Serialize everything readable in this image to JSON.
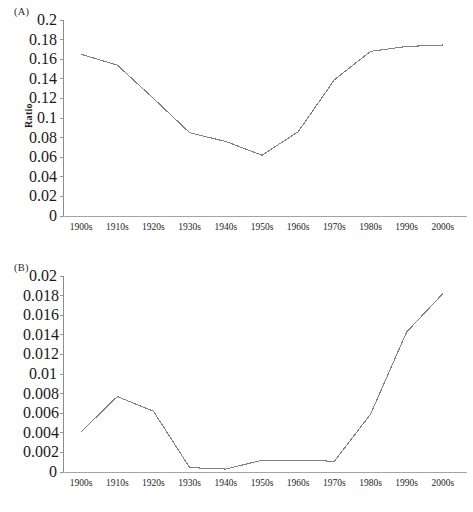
{
  "figure": {
    "panels": [
      {
        "key": "A",
        "label": "(A)",
        "ylabel": "Ratio"
      },
      {
        "key": "B",
        "label": "(B)",
        "ylabel": "Ratio"
      }
    ]
  },
  "chart_data": [
    {
      "panel": "(A)",
      "type": "line",
      "title": "",
      "xlabel": "",
      "ylabel": "Ratio",
      "categories": [
        "1900s",
        "1910s",
        "1920s",
        "1930s",
        "1940s",
        "1950s",
        "1960s",
        "1970s",
        "1980s",
        "1990s",
        "2000s"
      ],
      "values": [
        0.165,
        0.154,
        0.12,
        0.085,
        0.076,
        0.062,
        0.086,
        0.139,
        0.168,
        0.173,
        0.1745
      ],
      "ylim": [
        0,
        0.2
      ],
      "ytick_labels": [
        "0",
        "0.02",
        "0.04",
        "0.06",
        "0.08",
        "0.1",
        "0.12",
        "0.14",
        "0.16",
        "0.18",
        "0.2"
      ],
      "ytick_values": [
        0,
        0.02,
        0.04,
        0.06,
        0.08,
        0.1,
        0.12,
        0.14,
        0.16,
        0.18,
        0.2
      ],
      "grid": false,
      "legend": "none",
      "line_color": "#808080"
    },
    {
      "panel": "(B)",
      "type": "line",
      "title": "",
      "xlabel": "",
      "ylabel": "Ratio",
      "categories": [
        "1900s",
        "1910s",
        "1920s",
        "1930s",
        "1940s",
        "1950s",
        "1960s",
        "1970s",
        "1980s",
        "1990s",
        "2000s"
      ],
      "values": [
        0.0041,
        0.0077,
        0.0062,
        0.00045,
        0.0003,
        0.0012,
        0.0012,
        0.0011,
        0.0059,
        0.0143,
        0.0182
      ],
      "ylim": [
        0,
        0.02
      ],
      "ytick_labels": [
        "0",
        "0.002",
        "0.004",
        "0.006",
        "0.008",
        "0.01",
        "0.012",
        "0.014",
        "0.016",
        "0.018",
        "0.02"
      ],
      "ytick_values": [
        0,
        0.002,
        0.004,
        0.006,
        0.008,
        0.01,
        0.012,
        0.014,
        0.016,
        0.018,
        0.02
      ],
      "grid": false,
      "legend": "none",
      "line_color": "#808080"
    }
  ]
}
